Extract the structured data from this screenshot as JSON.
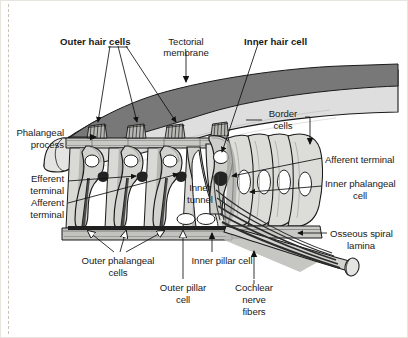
{
  "figure": {
    "background_color": "#ffffff",
    "border_color": "#e8e4de",
    "dashed_rule_color": "#c9c2b6"
  },
  "palette": {
    "tectorial_upper": "#7a7a7a",
    "tectorial_lower": "#d8d8d4",
    "cell_light": "#dcdcd8",
    "cell_mid": "#b4b4b0",
    "cell_dark": "#6e6e6e",
    "outline": "#1a1a1a",
    "nucleus": "#ffffff",
    "terminal_dark": "#222222",
    "nerve_fiber": "#3a3a3a",
    "label_text": "#1a1a1a"
  },
  "labels": [
    {
      "key": "outer_hair_cells",
      "text": "Outer hair cells",
      "bold": true,
      "x": 60,
      "y": 36,
      "align": "left"
    },
    {
      "key": "tectorial_membrane",
      "text": "Tectorial",
      "bold": false,
      "x": 186,
      "y": 36,
      "align": "center"
    },
    {
      "key": "tectorial_membrane2",
      "text": "membrane",
      "bold": false,
      "x": 186,
      "y": 47,
      "align": "center"
    },
    {
      "key": "inner_hair_cell",
      "text": "Inner hair cell",
      "bold": true,
      "x": 244,
      "y": 36,
      "align": "left"
    },
    {
      "key": "border_cells",
      "text": "Border",
      "bold": false,
      "x": 283,
      "y": 112,
      "align": "center"
    },
    {
      "key": "border_cells2",
      "text": "cells",
      "bold": false,
      "x": 283,
      "y": 124,
      "align": "center"
    },
    {
      "key": "phalangeal_process",
      "text": "Phalangeal",
      "bold": false,
      "x": 62,
      "y": 131,
      "align": "right"
    },
    {
      "key": "phalangeal_process2",
      "text": "process",
      "bold": false,
      "x": 62,
      "y": 143,
      "align": "right"
    },
    {
      "key": "afferent_terminal_r",
      "text": "Afferent terminal",
      "bold": false,
      "x": 325,
      "y": 161,
      "align": "left"
    },
    {
      "key": "efferent_terminal",
      "text": "Efferent",
      "bold": false,
      "x": 62,
      "y": 177,
      "align": "right"
    },
    {
      "key": "efferent_terminal2",
      "text": "terminal",
      "bold": false,
      "x": 62,
      "y": 189,
      "align": "right"
    },
    {
      "key": "inner_phalangeal",
      "text": "Inner phalangeal",
      "bold": false,
      "x": 325,
      "y": 183,
      "align": "left"
    },
    {
      "key": "inner_phalangeal2",
      "text": "cell",
      "bold": false,
      "x": 359,
      "y": 195,
      "align": "center"
    },
    {
      "key": "afferent_terminal_l",
      "text": "Afferent",
      "bold": false,
      "x": 62,
      "y": 199,
      "align": "right"
    },
    {
      "key": "afferent_terminal_l2",
      "text": "terminal",
      "bold": false,
      "x": 62,
      "y": 211,
      "align": "right"
    },
    {
      "key": "inner_tunnel",
      "text": "Inner",
      "bold": false,
      "x": 200,
      "y": 186,
      "align": "center"
    },
    {
      "key": "inner_tunnel2",
      "text": "tunnel",
      "bold": false,
      "x": 200,
      "y": 198,
      "align": "center"
    },
    {
      "key": "osseous_spiral",
      "text": "Osseous spiral",
      "bold": false,
      "x": 330,
      "y": 236,
      "align": "left"
    },
    {
      "key": "osseous_spiral2",
      "text": "lamina",
      "bold": false,
      "x": 360,
      "y": 248,
      "align": "center"
    },
    {
      "key": "outer_phalangeal",
      "text": "Outer phalangeal",
      "bold": false,
      "x": 118,
      "y": 258,
      "align": "center"
    },
    {
      "key": "outer_phalangeal2",
      "text": "cells",
      "bold": false,
      "x": 118,
      "y": 270,
      "align": "center"
    },
    {
      "key": "inner_pillar_cell",
      "text": "Inner pillar cell",
      "bold": false,
      "x": 222,
      "y": 258,
      "align": "center"
    },
    {
      "key": "outer_pillar_cell",
      "text": "Outer pillar",
      "bold": false,
      "x": 183,
      "y": 285,
      "align": "center"
    },
    {
      "key": "outer_pillar_cell2",
      "text": "cell",
      "bold": false,
      "x": 183,
      "y": 297,
      "align": "center"
    },
    {
      "key": "cochlear_nerve",
      "text": "Cochlear",
      "bold": false,
      "x": 254,
      "y": 285,
      "align": "center"
    },
    {
      "key": "cochlear_nerve2",
      "text": "nerve",
      "bold": false,
      "x": 254,
      "y": 297,
      "align": "center"
    },
    {
      "key": "cochlear_nerve3",
      "text": "fibers",
      "bold": false,
      "x": 254,
      "y": 309,
      "align": "center"
    }
  ],
  "structures": [
    "tectorial-membrane",
    "reticular-lamina",
    "outer-hair-cell-1",
    "outer-hair-cell-2",
    "outer-hair-cell-3",
    "inner-hair-cell",
    "outer-phalangeal-cells",
    "inner-pillar-cell",
    "outer-pillar-cell",
    "border-cells",
    "inner-phalangeal-cell",
    "basilar-membrane",
    "osseous-spiral-lamina",
    "cochlear-nerve-fibers",
    "inner-tunnel"
  ]
}
